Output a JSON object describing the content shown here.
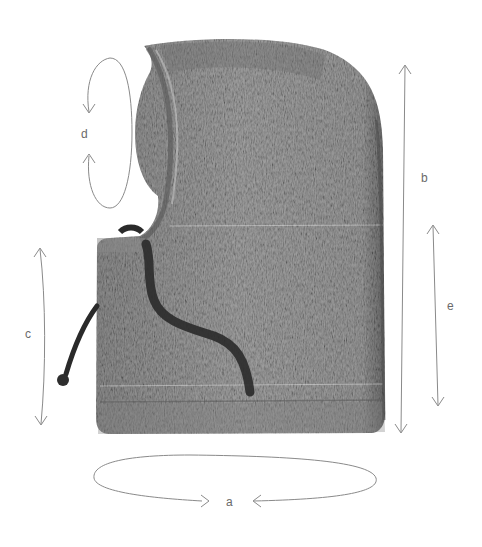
{
  "figure": {
    "colors": {
      "background": "#ffffff",
      "knit_base": "#9a9a9a",
      "knit_dark": "#5e5e5e",
      "knit_light": "#b8b8b8",
      "drawstring": "#2a2a2a",
      "annotation_line": "#8a8a8a",
      "annotation_text": "#6a6a6a"
    }
  },
  "measurements": [
    {
      "id": "a",
      "label": "a",
      "kind": "circumference-loop",
      "position": "bottom hem"
    },
    {
      "id": "b",
      "label": "b",
      "kind": "vertical-double-arrow",
      "position": "total height, right side"
    },
    {
      "id": "c",
      "label": "c",
      "kind": "vertical-double-arrow",
      "position": "neck/collar height, left side"
    },
    {
      "id": "d",
      "label": "d",
      "kind": "circumference-loop",
      "position": "face opening"
    },
    {
      "id": "e",
      "label": "e",
      "kind": "vertical-double-arrow",
      "position": "lower body height, right side"
    }
  ]
}
